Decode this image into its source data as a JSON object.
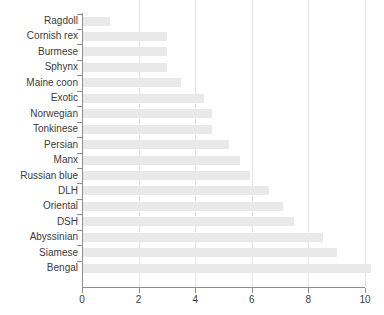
{
  "chart_data": {
    "type": "bar",
    "orientation": "horizontal",
    "title": "",
    "xlabel": "",
    "ylabel": "",
    "xlim": [
      0,
      10.4
    ],
    "xticks": [
      0,
      2,
      4,
      6,
      8,
      10
    ],
    "xtick_labels": [
      "0",
      "2",
      "4",
      "6",
      "8",
      "10"
    ],
    "grid": "vertical",
    "legend": "none",
    "bar_color": "#e9e9e9",
    "axis_color": "#8d8d8d",
    "gridline_color": "#e3e3e3",
    "text_color": "#3b3b3b",
    "categories": [
      "Ragdoll",
      "Cornish rex",
      "Burmese",
      "Sphynx",
      "Maine coon",
      "Exotic",
      "Norwegian",
      "Tonkinese",
      "Persian",
      "Manx",
      "Russian blue",
      "DLH",
      "Oriental",
      "DSH",
      "Abyssinian",
      "Siamese",
      "Bengal"
    ],
    "values": [
      1.0,
      3.0,
      3.0,
      3.0,
      3.5,
      4.3,
      4.6,
      4.6,
      5.2,
      5.6,
      5.95,
      6.6,
      7.1,
      7.5,
      8.5,
      9.0,
      10.2
    ]
  }
}
